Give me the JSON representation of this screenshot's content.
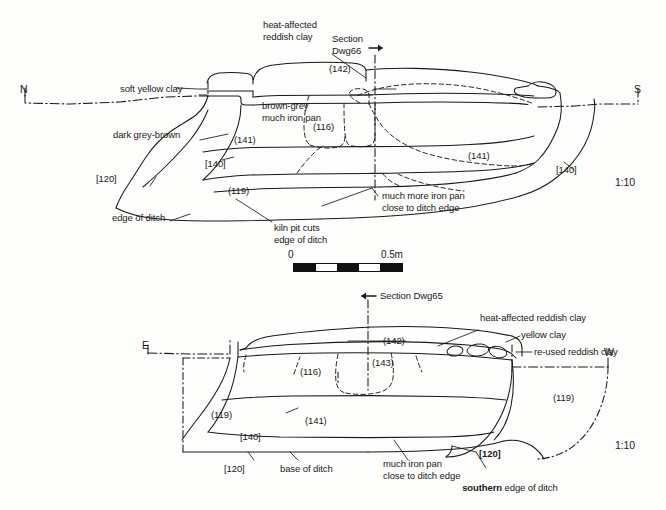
{
  "figure": {
    "type": "archaeological-section-drawing",
    "background_color": "#fdfdfc",
    "line_color": "#1a1a1a"
  },
  "scale_bar": {
    "zero_label": "0",
    "max_label": "0.5m",
    "segments": [
      "dark",
      "light",
      "dark",
      "light",
      "dark"
    ]
  },
  "top_section": {
    "ratio": "1:10",
    "compass_left": "N",
    "compass_right": "S",
    "section_marker": "Section\nDwg66",
    "labels": {
      "heat_affected": "heat-affected\nreddish clay",
      "soft_yellow_clay": "soft yellow clay",
      "brown_grey": "brown-grey\nmuch iron pan",
      "dark_grey_brown": "dark grey-brown",
      "edge_of_ditch": "edge of ditch",
      "kiln_pit": "kiln pit cuts\nedge of ditch",
      "much_more_iron_pan": "much more iron pan\nclose to ditch edge"
    },
    "contexts": {
      "c142": "(142)",
      "c116": "(116)",
      "c141_left": "(141)",
      "c141_right": "(141)",
      "c119": "(119)",
      "c140_left": "[140]",
      "c140_right": "[140]",
      "c120": "[120]"
    }
  },
  "bottom_section": {
    "ratio": "1:10",
    "compass_left": "E",
    "compass_right": "W",
    "section_marker": "Section Dwg65",
    "labels": {
      "heat_affected": "heat-affected reddish clay",
      "yellow_clay": "yellow clay",
      "re_used_reddish_clay": "re-used reddish clay",
      "base_of_ditch": "base of ditch",
      "much_iron_pan": "much iron pan\nclose to ditch edge",
      "southern_edge_bold": "southern",
      "southern_edge_rest": " edge of ditch"
    },
    "contexts": {
      "c142": "(142)",
      "c143": "(143)",
      "c116": "(116)",
      "c141": "(141)",
      "c119_left": "(119)",
      "c119_right": "(119)",
      "c140": "[140]",
      "c120_left": "[120]",
      "c120_right": "[120]"
    }
  }
}
